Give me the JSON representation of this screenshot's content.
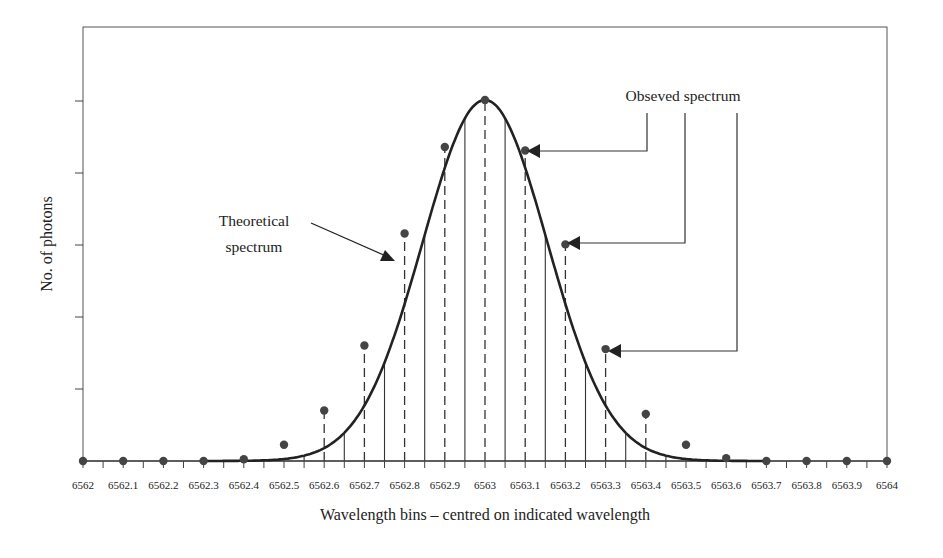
{
  "chart_data": {
    "type": "line",
    "title": "",
    "xlabel": "Wavelength bins – centred on indicated wavelength",
    "ylabel": "No. of photons",
    "xlim": [
      6562,
      6564
    ],
    "x_ticks": [
      "6562",
      "6562.1",
      "6562.2",
      "6562.3",
      "6562.4",
      "6562.5",
      "6562.6",
      "6562.7",
      "6562.8",
      "6562.9",
      "6563",
      "6563.1",
      "6563.2",
      "6563.3",
      "6563.4",
      "6563.5",
      "6563.6",
      "6563.7",
      "6563.8",
      "6563.9",
      "6564"
    ],
    "y_ticks_count": 5,
    "y_tick_labels": [],
    "grid": false,
    "series": [
      {
        "name": "Theoretical spectrum",
        "style": "smooth-curve",
        "shape": "gaussian",
        "center": 6563.0,
        "peak_relative": 1.0
      },
      {
        "name": "Observed spectrum",
        "style": "points",
        "x": [
          6562,
          6562.1,
          6562.2,
          6562.3,
          6562.4,
          6562.5,
          6562.6,
          6562.7,
          6562.8,
          6562.9,
          6563,
          6563.1,
          6563.2,
          6563.3,
          6563.4,
          6563.5,
          6563.6,
          6563.7,
          6563.8,
          6563.9,
          6564
        ],
        "values_relative": [
          0,
          0,
          0,
          0,
          0.005,
          0.045,
          0.14,
          0.32,
          0.63,
          0.87,
          1.0,
          0.86,
          0.6,
          0.31,
          0.13,
          0.045,
          0.008,
          0,
          0,
          0,
          0
        ]
      }
    ],
    "annotations": [
      {
        "text": "Theoretical spectrum",
        "lines": [
          "Theoretical",
          "spectrum"
        ],
        "points_to": "curve near 6562.75"
      },
      {
        "text": "Obseved spectrum",
        "points_to": [
          "6563.1",
          "6563.2",
          "6563.3"
        ]
      }
    ],
    "bin_lines": "solid vertical lines at bin edges (x.x5), dashed vertical lines at bin centres"
  },
  "labels": {
    "ylabel": "No. of photons",
    "xlabel": "Wavelength bins – centred on indicated wavelength",
    "theoretical_line1": "Theoretical",
    "theoretical_line2": "spectrum",
    "observed": "Obseved spectrum"
  }
}
